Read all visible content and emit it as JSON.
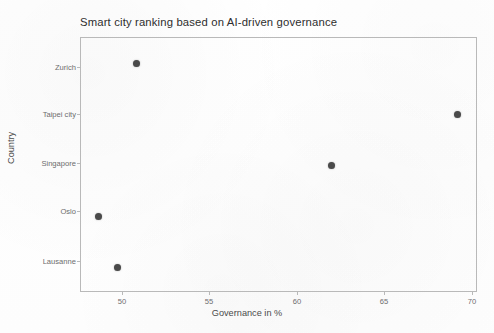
{
  "chart_data": {
    "type": "scatter",
    "title": "Smart city ranking based on AI-driven governance",
    "xlabel": "Governance in %",
    "ylabel": "Country",
    "categories": [
      "Zurich",
      "Taipei city",
      "Singapore",
      "Oslo",
      "Lausanne"
    ],
    "x": [
      50.5,
      69.1,
      61.8,
      48.3,
      49.4
    ],
    "points": [
      {
        "country": "Zurich",
        "governance": 50.5
      },
      {
        "country": "Taipei city",
        "governance": 69.1
      },
      {
        "country": "Singapore",
        "governance": 61.8
      },
      {
        "country": "Oslo",
        "governance": 48.3
      },
      {
        "country": "Lausanne",
        "governance": 49.4
      }
    ],
    "xticks": [
      "50",
      "55",
      "60",
      "65",
      "70"
    ],
    "xtick_values": [
      50,
      55,
      60,
      65,
      70
    ],
    "xlim": [
      47.3,
      70.3
    ],
    "grid": false,
    "legend": "none",
    "marker_color": "#4a4a4a",
    "frame_color": "#b9b9b9",
    "tick_label_color": "#6d6d6d",
    "title_color": "#2e2e2e",
    "background_color": "#ffffff"
  }
}
